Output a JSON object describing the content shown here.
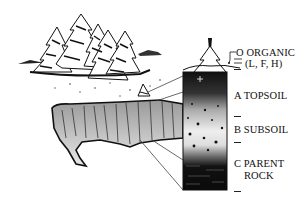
{
  "diagram": {
    "type": "soil profile cross-section",
    "scene": [
      "conifer-trees",
      "hillside-cutaway",
      "small-tree",
      "soil-column"
    ],
    "horizons": [
      {
        "code": "O",
        "name": "ORGANIC",
        "sub": "(L, F, H)"
      },
      {
        "code": "A",
        "name": "TOPSOIL"
      },
      {
        "code": "B",
        "name": "SUBSOIL"
      },
      {
        "code": "C",
        "name": "PARENT",
        "name2": "ROCK"
      }
    ]
  },
  "labels": {
    "o_line1": "O ORGANIC",
    "o_line2": "(L, F, H)",
    "a": "A TOPSOIL",
    "b": "B SUBSOIL",
    "c_line1": "C PARENT",
    "c_line2": "ROCK"
  },
  "colors": {
    "ink": "#111111",
    "background": "#ffffff"
  }
}
